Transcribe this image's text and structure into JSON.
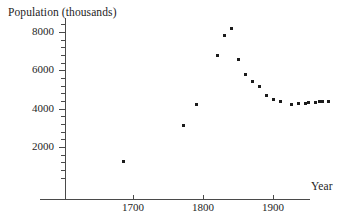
{
  "chart_data": {
    "type": "scatter",
    "title": "",
    "ylabel": "Population (thousands)",
    "xlabel": "Year",
    "xlim": [
      1610,
      1995
    ],
    "ylim": [
      0,
      8800
    ],
    "grid": false,
    "legend": null,
    "x_ticks": [
      1700,
      1800,
      1900
    ],
    "x_tick_labels": [
      "1700",
      "1800",
      "1900"
    ],
    "y_ticks": [
      2000,
      4000,
      6000,
      8000
    ],
    "y_tick_labels": [
      "2000",
      "4000",
      "6000",
      "8000"
    ],
    "y_minor_tick_step": 400,
    "series_name": "Population",
    "marker": "square",
    "marker_color": "#1b1b1b",
    "x": [
      1687,
      1772,
      1791,
      1821,
      1831,
      1841,
      1851,
      1861,
      1871,
      1881,
      1891,
      1901,
      1911,
      1926,
      1936,
      1946,
      1951,
      1961,
      1966,
      1971,
      1979
    ],
    "y": [
      1250,
      3100,
      4200,
      6800,
      7800,
      8180,
      6550,
      5800,
      5400,
      5170,
      4700,
      4460,
      4390,
      4230,
      4250,
      4250,
      4330,
      4320,
      4370,
      4370,
      4390
    ],
    "points": [
      {
        "year": 1687,
        "population": 1250
      },
      {
        "year": 1772,
        "population": 3100
      },
      {
        "year": 1791,
        "population": 4200
      },
      {
        "year": 1821,
        "population": 6800
      },
      {
        "year": 1831,
        "population": 7800
      },
      {
        "year": 1841,
        "population": 8180
      },
      {
        "year": 1851,
        "population": 6550
      },
      {
        "year": 1861,
        "population": 5800
      },
      {
        "year": 1871,
        "population": 5400
      },
      {
        "year": 1881,
        "population": 5170
      },
      {
        "year": 1891,
        "population": 4700
      },
      {
        "year": 1901,
        "population": 4460
      },
      {
        "year": 1911,
        "population": 4390
      },
      {
        "year": 1926,
        "population": 4230
      },
      {
        "year": 1936,
        "population": 4250
      },
      {
        "year": 1946,
        "population": 4250
      },
      {
        "year": 1951,
        "population": 4330
      },
      {
        "year": 1961,
        "population": 4320
      },
      {
        "year": 1966,
        "population": 4370
      },
      {
        "year": 1971,
        "population": 4370
      },
      {
        "year": 1979,
        "population": 4390
      }
    ]
  },
  "axes": {
    "y_title": "Population (thousands)",
    "x_title": "Year"
  }
}
